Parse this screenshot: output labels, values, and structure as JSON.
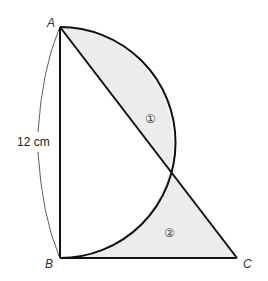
{
  "figure": {
    "points": {
      "A": {
        "label": "A",
        "x": 60,
        "y": 27
      },
      "B": {
        "label": "B",
        "x": 60,
        "y": 258
      },
      "C": {
        "label": "C",
        "x": 237,
        "y": 258
      }
    },
    "dimension_label": "12 cm",
    "regions": [
      {
        "id": "1",
        "label": "①"
      },
      {
        "id": "2",
        "label": "②"
      }
    ],
    "colors": {
      "stroke": "#111111",
      "shade": "#eeeeee",
      "background": "#ffffff"
    }
  }
}
